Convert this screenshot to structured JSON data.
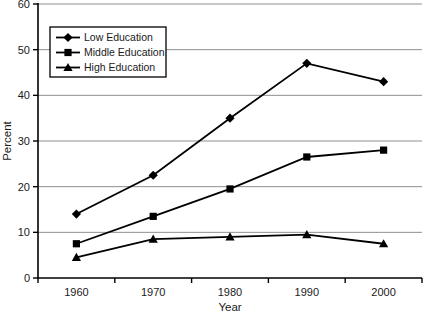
{
  "chart_data": {
    "type": "line",
    "title": "",
    "xlabel": "Year",
    "ylabel": "Percent",
    "categories": [
      "1960",
      "1970",
      "1980",
      "1990",
      "2000"
    ],
    "series": [
      {
        "name": "Low Education",
        "marker": "diamond",
        "values": [
          14,
          22.5,
          35,
          47,
          43
        ]
      },
      {
        "name": "Middle Education",
        "marker": "square",
        "values": [
          7.5,
          13.5,
          19.5,
          26.5,
          28
        ]
      },
      {
        "name": "High Education",
        "marker": "triangle",
        "values": [
          4.5,
          8.5,
          9,
          9.5,
          7.5
        ]
      }
    ],
    "ylim": [
      0,
      60
    ],
    "yticks": [
      0,
      10,
      20,
      30,
      40,
      50,
      60
    ],
    "grid": true,
    "legend_position": "top-left",
    "colors": {
      "line": "#000000",
      "marker": "#000000",
      "grid": "#8f8f8f",
      "axis": "#000000",
      "background": "#ffffff"
    }
  }
}
